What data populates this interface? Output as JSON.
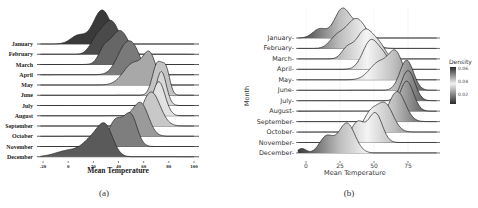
{
  "chart_data": [
    {
      "type": "ridgeline",
      "panel": "(a)",
      "title": "",
      "xlabel": "Mean Temperature",
      "ylabel": "",
      "x_ticks": [
        -20,
        0,
        20,
        40,
        60,
        80,
        100
      ],
      "xlim": [
        -22,
        102
      ],
      "grid": false,
      "legend": null,
      "categories": [
        "January",
        "February",
        "March",
        "April",
        "May",
        "June",
        "July",
        "August",
        "September",
        "October",
        "November",
        "December"
      ],
      "series": [
        {
          "name": "January",
          "fill": "#3a3a3a",
          "peaks": [
            [
              8,
              0.25,
              6
            ],
            [
              27,
              1.0,
              7
            ]
          ]
        },
        {
          "name": "February",
          "fill": "#4a4a4a",
          "peaks": [
            [
              22,
              0.35,
              5
            ],
            [
              34,
              1.0,
              7
            ]
          ]
        },
        {
          "name": "March",
          "fill": "#666666",
          "peaks": [
            [
              28,
              0.3,
              4
            ],
            [
              41,
              1.0,
              8
            ]
          ]
        },
        {
          "name": "April",
          "fill": "#7a7a7a",
          "peaks": [
            [
              46,
              1.0,
              7
            ],
            [
              54,
              0.4,
              5
            ]
          ]
        },
        {
          "name": "May",
          "fill": "#a8a8a8",
          "peaks": [
            [
              52,
              0.8,
              8
            ],
            [
              65,
              1.0,
              5
            ]
          ]
        },
        {
          "name": "June",
          "fill": "#c4c4c4",
          "peaks": [
            [
              71,
              1.0,
              4
            ],
            [
              78,
              0.7,
              3
            ]
          ]
        },
        {
          "name": "July",
          "fill": "#d8d8d8",
          "peaks": [
            [
              74,
              1.0,
              4
            ]
          ]
        },
        {
          "name": "August",
          "fill": "#e2e2e2",
          "peaks": [
            [
              72,
              1.0,
              5
            ]
          ]
        },
        {
          "name": "September",
          "fill": "#c8c8c8",
          "peaks": [
            [
              66,
              1.0,
              7
            ]
          ]
        },
        {
          "name": "October",
          "fill": "#9a9a9a",
          "peaks": [
            [
              46,
              0.5,
              6
            ],
            [
              58,
              1.0,
              6
            ]
          ]
        },
        {
          "name": "November",
          "fill": "#7e7e7e",
          "peaks": [
            [
              38,
              0.9,
              6
            ],
            [
              50,
              1.0,
              5
            ]
          ]
        },
        {
          "name": "December",
          "fill": "#5a5a5a",
          "peaks": [
            [
              0,
              0.25,
              10
            ],
            [
              20,
              0.7,
              8
            ],
            [
              30,
              1.0,
              6
            ]
          ]
        }
      ]
    },
    {
      "type": "ridgeline",
      "panel": "(b)",
      "title": "",
      "xlabel": "Mean Temperature",
      "ylabel": "Month",
      "x_ticks": [
        0,
        25,
        50,
        75
      ],
      "xlim": [
        -6,
        96
      ],
      "grid": true,
      "legend": {
        "title": "Density",
        "position": "right",
        "ticks": [
          0.06,
          0.04,
          0.02
        ]
      },
      "categories": [
        "January",
        "February",
        "March",
        "April",
        "May",
        "June",
        "July",
        "August",
        "September",
        "October",
        "November",
        "December"
      ],
      "series": [
        {
          "name": "January",
          "peaks": [
            [
              10,
              0.3,
              5
            ],
            [
              27,
              1.0,
              6
            ],
            [
              38,
              0.3,
              4
            ]
          ]
        },
        {
          "name": "February",
          "peaks": [
            [
              22,
              0.3,
              5
            ],
            [
              37,
              1.0,
              8
            ]
          ]
        },
        {
          "name": "March",
          "peaks": [
            [
              30,
              0.3,
              4
            ],
            [
              44,
              1.0,
              7
            ],
            [
              55,
              0.25,
              4
            ]
          ]
        },
        {
          "name": "April",
          "peaks": [
            [
              48,
              1.0,
              6
            ],
            [
              58,
              0.3,
              4
            ]
          ]
        },
        {
          "name": "May",
          "peaks": [
            [
              54,
              0.7,
              7
            ],
            [
              66,
              1.0,
              5
            ]
          ]
        },
        {
          "name": "June",
          "peaks": [
            [
              74,
              1.0,
              5
            ]
          ]
        },
        {
          "name": "July",
          "peaks": [
            [
              75,
              1.0,
              5
            ]
          ]
        },
        {
          "name": "August",
          "peaks": [
            [
              74,
              1.0,
              5
            ]
          ]
        },
        {
          "name": "September",
          "peaks": [
            [
              67,
              1.0,
              6
            ]
          ]
        },
        {
          "name": "October",
          "peaks": [
            [
              47,
              0.6,
              5
            ],
            [
              58,
              1.0,
              6
            ]
          ]
        },
        {
          "name": "November",
          "peaks": [
            [
              38,
              0.7,
              5
            ],
            [
              51,
              1.0,
              5
            ]
          ]
        },
        {
          "name": "December",
          "peaks": [
            [
              -3,
              0.15,
              3
            ],
            [
              15,
              0.55,
              5
            ],
            [
              30,
              1.0,
              6
            ]
          ]
        }
      ]
    }
  ],
  "panels": {
    "a": {
      "caption": "(a)",
      "xlabel": "Mean Temperature"
    },
    "b": {
      "caption": "(b)",
      "xlabel": "Mean Temperature",
      "ylabel": "Month",
      "legend_title": "Density",
      "legend_ticks": [
        "0.06",
        "0.04",
        "0.02"
      ]
    }
  }
}
